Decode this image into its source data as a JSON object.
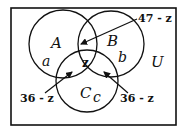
{
  "diagram": {
    "type": "venn",
    "universe_label": "U",
    "sets": [
      {
        "name": "A",
        "region_label": "a"
      },
      {
        "name": "B",
        "region_label": "b"
      },
      {
        "name": "C",
        "region_label": "c"
      }
    ],
    "center_label": "z",
    "annotations": [
      {
        "text": "47 - z",
        "points_to": "A∩B only"
      },
      {
        "text": "36 - z",
        "points_to": "A∩C only"
      },
      {
        "text": "36 - z",
        "points_to": "B∩C only"
      }
    ],
    "colors": {
      "stroke": "#111111",
      "background": "#ffffff"
    }
  }
}
